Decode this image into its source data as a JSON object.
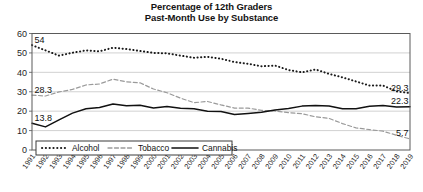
{
  "chart_data": {
    "type": "line",
    "title": "Percentage of 12th Graders\nPast-Month Use by Substance",
    "title_lines": [
      "Percentage of 12th Graders",
      "Past-Month Use by Substance"
    ],
    "xlabel": "",
    "ylabel": "",
    "ylim": [
      0,
      60
    ],
    "yticks": [
      0,
      10,
      20,
      30,
      40,
      50,
      60
    ],
    "ytick_labels": [
      "0",
      "10",
      "20",
      "30",
      "40",
      "50",
      "60"
    ],
    "grid": true,
    "grid_axis": "y",
    "legend_position": "bottom-left",
    "x": [
      1991,
      1992,
      1993,
      1994,
      1995,
      1996,
      1997,
      1998,
      1999,
      2000,
      2001,
      2002,
      2003,
      2004,
      2005,
      2006,
      2007,
      2008,
      2009,
      2010,
      2011,
      2012,
      2013,
      2014,
      2015,
      2016,
      2017,
      2018,
      2019
    ],
    "xtick_labels": [
      "1991",
      "1992",
      "1993",
      "1994",
      "1995",
      "1996",
      "1997",
      "1998",
      "1999",
      "2000",
      "2001",
      "2002",
      "2003",
      "2004",
      "2005",
      "2006",
      "2007",
      "2008",
      "2009",
      "2010",
      "2011",
      "2012",
      "2013",
      "2014",
      "2015",
      "2016",
      "2017",
      "2018",
      "2019"
    ],
    "series": [
      {
        "name": "Alcohol",
        "style": "dotted",
        "color": "#1a1a1a",
        "values": [
          54.0,
          51.3,
          48.6,
          50.1,
          51.3,
          50.8,
          52.7,
          52.0,
          51.0,
          50.0,
          49.8,
          48.6,
          47.5,
          48.0,
          47.0,
          45.3,
          44.4,
          43.1,
          43.5,
          41.2,
          40.0,
          41.5,
          39.2,
          37.4,
          35.3,
          33.2,
          33.2,
          30.2,
          29.3
        ],
        "label_first": "54",
        "label_last": "29.3"
      },
      {
        "name": "Tobacco",
        "style": "dashed",
        "color": "#9a9a9a",
        "values": [
          28.3,
          27.8,
          29.9,
          31.2,
          33.5,
          34.0,
          36.5,
          35.1,
          34.6,
          31.4,
          29.5,
          26.7,
          24.4,
          25.0,
          23.2,
          21.6,
          21.6,
          20.4,
          20.1,
          19.2,
          18.7,
          17.1,
          16.3,
          13.6,
          11.4,
          10.5,
          9.7,
          7.6,
          5.7
        ],
        "label_first": "28.3",
        "label_last": "5.7"
      },
      {
        "name": "Cannabis",
        "style": "solid",
        "color": "#111111",
        "values": [
          13.8,
          11.9,
          15.5,
          19.0,
          21.2,
          21.9,
          23.7,
          22.8,
          23.1,
          21.6,
          22.4,
          21.5,
          21.2,
          19.9,
          19.8,
          18.3,
          18.8,
          19.4,
          20.6,
          21.4,
          22.6,
          22.9,
          22.7,
          21.2,
          21.3,
          22.5,
          22.9,
          22.2,
          22.3
        ],
        "label_first": "13.8",
        "label_last": "22.3"
      }
    ],
    "annotations": [
      {
        "text": "54",
        "series": "Alcohol",
        "x": 1991,
        "y": 54.0
      },
      {
        "text": "28.3",
        "series": "Tobacco",
        "x": 1991,
        "y": 28.3
      },
      {
        "text": "13.8",
        "series": "Cannabis",
        "x": 1991,
        "y": 13.8
      },
      {
        "text": "29.3",
        "series": "Alcohol",
        "x": 2019,
        "y": 29.3
      },
      {
        "text": "22.3",
        "series": "Cannabis",
        "x": 2019,
        "y": 22.3
      },
      {
        "text": "5.7",
        "series": "Tobacco",
        "x": 2019,
        "y": 5.7
      }
    ],
    "legend": [
      {
        "label": "Alcohol",
        "style": "dotted",
        "color": "#1a1a1a"
      },
      {
        "label": "Tobacco",
        "style": "dashed",
        "color": "#9a9a9a"
      },
      {
        "label": "Cannabis",
        "style": "solid",
        "color": "#111111"
      }
    ]
  }
}
